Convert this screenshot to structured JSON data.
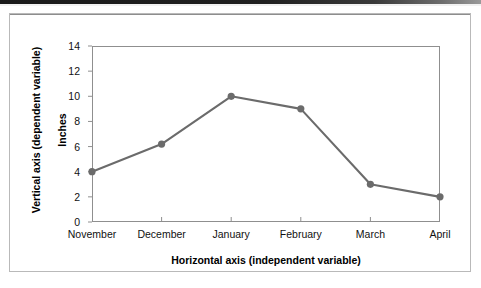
{
  "figure": {
    "vertical_axis_caption": "Vertical axis (dependent variable)",
    "horizontal_axis_caption": "Horizontal axis (independent variable)"
  },
  "chart_data": {
    "type": "line",
    "title": "",
    "xlabel": "Horizontal axis (independent variable)",
    "ylabel": "Inches",
    "categories": [
      "November",
      "December",
      "January",
      "February",
      "March",
      "April"
    ],
    "values": [
      4,
      6.2,
      10,
      9,
      3,
      2
    ],
    "yticks": [
      0,
      2,
      4,
      6,
      8,
      10,
      12,
      14
    ],
    "ylim": [
      0,
      14
    ],
    "grid": false,
    "legend": "none",
    "series_color": "#6b6b6b",
    "marker": "circle",
    "marker_color": "#6b6b6b",
    "axis_color": "#8f8f8f"
  }
}
